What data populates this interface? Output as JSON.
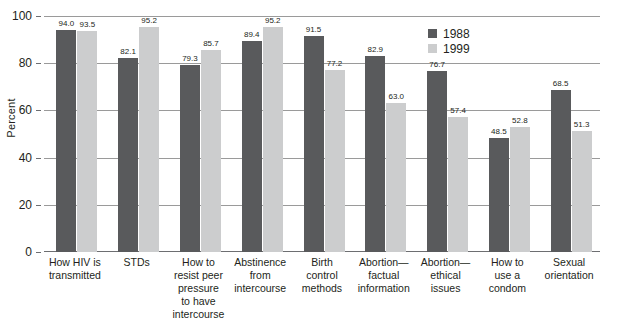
{
  "chart_data": {
    "type": "bar",
    "title": "",
    "xlabel": "",
    "ylabel": "Percent",
    "ylim": [
      0,
      100
    ],
    "yticks": [
      0,
      20,
      40,
      60,
      80,
      100
    ],
    "grid": true,
    "legend_position": "top-right",
    "categories": [
      "How HIV is transmitted",
      "STDs",
      "How to resist peer pressure to have intercourse",
      "Abstinence from intercourse",
      "Birth control methods",
      "Abortion—factual information",
      "Abortion—ethical issues",
      "How to use a condom",
      "Sexual orientation"
    ],
    "category_lines": [
      [
        "How HIV is",
        "transmitted"
      ],
      [
        "STDs"
      ],
      [
        "How to",
        "resist peer",
        "pressure",
        "to have",
        "intercourse"
      ],
      [
        "Abstinence",
        "from",
        "intercourse"
      ],
      [
        "Birth",
        "control",
        "methods"
      ],
      [
        "Abortion—",
        "factual",
        "information"
      ],
      [
        "Abortion—",
        "ethical",
        "issues"
      ],
      [
        "How to",
        "use a",
        "condom"
      ],
      [
        "Sexual",
        "orientation"
      ]
    ],
    "series": [
      {
        "name": "1988",
        "color": "#595a5c",
        "values": [
          94.0,
          82.1,
          79.3,
          89.4,
          91.5,
          82.9,
          76.7,
          48.5,
          68.5
        ],
        "labels": [
          "94.0",
          "82.1",
          "79.3",
          "89.4",
          "91.5",
          "82.9",
          "76.7",
          "48.5",
          "68.5"
        ]
      },
      {
        "name": "1999",
        "color": "#cccdce",
        "values": [
          93.5,
          95.2,
          85.7,
          95.2,
          77.2,
          63.0,
          57.4,
          52.8,
          51.3
        ],
        "labels": [
          "93.5",
          "95.2",
          "85.7",
          "95.2",
          "77.2",
          "63.0",
          "57.4",
          "52.8",
          "51.3"
        ]
      }
    ]
  },
  "axis": {
    "y_title": "Percent",
    "y_tick_labels": [
      "100",
      "80",
      "60",
      "40",
      "20",
      "0"
    ]
  },
  "legend": {
    "items": [
      {
        "label": "1988",
        "color": "#595a5c"
      },
      {
        "label": "1999",
        "color": "#cccdce"
      }
    ]
  }
}
